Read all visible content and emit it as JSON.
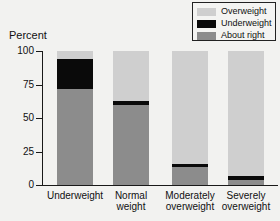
{
  "chart_data": {
    "type": "bar",
    "subtype": "stacked-percent",
    "title": "",
    "xlabel": "",
    "ylabel": "Percent",
    "ylim": [
      0,
      100
    ],
    "yticks": [
      0,
      25,
      50,
      75,
      100
    ],
    "ytick_labels": [
      "0",
      "25",
      "50",
      "75",
      "100"
    ],
    "grid": false,
    "legend_position": "top-right",
    "categories": [
      "Underweight",
      "Normal\nweight",
      "Moderately\noverweight",
      "Severely\noverweight"
    ],
    "series": [
      {
        "name": "About right",
        "color": "#8c8c8c",
        "values": [
          72,
          60,
          13.5,
          3.5
        ]
      },
      {
        "name": "Underweight",
        "color": "#0a0a0a",
        "values": [
          22,
          3,
          2.5,
          3
        ]
      },
      {
        "name": "Overweight",
        "color": "#cfcfcf",
        "values": [
          6,
          37,
          84,
          93.5
        ]
      }
    ],
    "stack_order_bottom_to_top": [
      "About right",
      "Underweight",
      "Overweight"
    ]
  },
  "legend": {
    "items": [
      {
        "label": "Overweight",
        "color": "#cfcfcf"
      },
      {
        "label": "Underweight",
        "color": "#0a0a0a"
      },
      {
        "label": "About right",
        "color": "#8c8c8c"
      }
    ]
  },
  "axis": {
    "y_title": "Percent",
    "y_ticks": [
      "100",
      "75",
      "50",
      "25",
      "0"
    ]
  },
  "colors": {
    "overweight": "#cfcfcf",
    "underweight": "#0a0a0a",
    "about_right": "#8c8c8c",
    "axis": "#191919",
    "background": "#f2f2f0"
  }
}
